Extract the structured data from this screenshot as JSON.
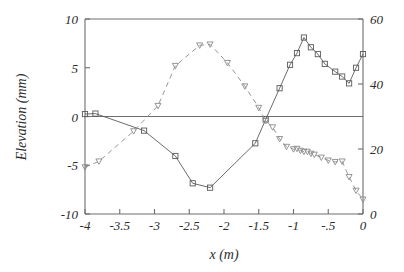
{
  "chart_data": {
    "type": "line",
    "title": "",
    "subtitle": "",
    "xlabel": "x (m)",
    "ylabel": "Elevation (mm)",
    "y2label": "",
    "xlim": [
      -4,
      0
    ],
    "ylim": [
      -10,
      10
    ],
    "y2lim": [
      0,
      60
    ],
    "grid": false,
    "legend": "none",
    "annotations": [],
    "xticks": [
      -4,
      -3.5,
      -3,
      -2.5,
      -2,
      -1.5,
      -1,
      -0.5,
      0
    ],
    "xticklabels": [
      "-4",
      "-3.5",
      "-3",
      "-2.5",
      "-2",
      "-1.5",
      "-1",
      "-.5",
      "0"
    ],
    "yticks": [
      -10,
      -5,
      0,
      5,
      10
    ],
    "yticklabels": [
      "-10",
      "-5",
      "0",
      "5",
      "10"
    ],
    "y2ticks": [
      0,
      20,
      40,
      60
    ],
    "y2ticklabels": [
      "0",
      "20",
      "40",
      "60"
    ],
    "zero_line": 0,
    "series": [
      {
        "name": "elevation-solid",
        "style": "solid",
        "marker": "square",
        "axis": "left",
        "color": "#5a5a5a",
        "x": [
          -4.0,
          -3.85,
          -3.15,
          -2.7,
          -2.45,
          -2.2,
          -1.55,
          -1.4,
          -1.2,
          -1.05,
          -0.95,
          -0.85,
          -0.75,
          -0.65,
          -0.55,
          -0.4,
          -0.3,
          -0.2,
          -0.1,
          0.0
        ],
        "y": [
          0.25,
          0.3,
          -1.45,
          -4.05,
          -6.85,
          -7.3,
          -2.75,
          -0.3,
          2.9,
          5.3,
          6.5,
          8.1,
          7.1,
          6.4,
          5.4,
          4.6,
          4.1,
          3.4,
          5.0,
          6.4
        ]
      },
      {
        "name": "elevation-dashed",
        "style": "dashed",
        "marker": "triangle-down",
        "axis": "left",
        "color": "#8a8a8a",
        "x": [
          -4.0,
          -3.8,
          -3.3,
          -2.95,
          -2.7,
          -2.35,
          -2.2,
          -1.95,
          -1.7,
          -1.5,
          -1.4,
          -1.3,
          -1.2,
          -1.1,
          -1.0,
          -0.95,
          -0.9,
          -0.85,
          -0.8,
          -0.75,
          -0.7,
          -0.6,
          -0.5,
          -0.4,
          -0.3,
          -0.2,
          -0.1,
          0.0
        ],
        "y": [
          -5.2,
          -4.6,
          -1.5,
          1.1,
          5.2,
          7.3,
          7.4,
          5.5,
          3.1,
          0.9,
          -0.45,
          -1.1,
          -2.3,
          -3.1,
          -3.35,
          -3.3,
          -3.5,
          -3.6,
          -3.6,
          -3.8,
          -3.9,
          -4.2,
          -4.5,
          -4.65,
          -4.6,
          -6.2,
          -7.6,
          -8.5
        ]
      }
    ]
  },
  "axes": {
    "plot_left_px": 85,
    "plot_right_px": 363,
    "plot_top_px": 19,
    "plot_bottom_px": 214
  }
}
